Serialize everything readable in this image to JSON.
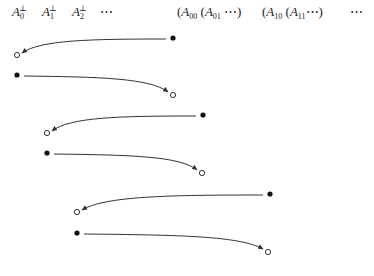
{
  "header": {
    "left_terms": [
      {
        "base": "A",
        "sub": "0",
        "sup": "⊥",
        "x": 12
      },
      {
        "base": "A",
        "sub": "1",
        "sup": "⊥",
        "x": 42
      },
      {
        "base": "A",
        "sub": "2",
        "sup": "⊥",
        "x": 72
      }
    ],
    "left_ellipsis": {
      "text": "⋯",
      "x": 100
    },
    "group_a": {
      "open1": "(",
      "A00_base": "A",
      "A00_sub": "00",
      "open2": "(",
      "A01_base": "A",
      "A01_sub": "01",
      "tail": "⋯)",
      "x": 177
    },
    "group_b": {
      "open1": "(",
      "A10_base": "A",
      "A10_sub": "10",
      "open2": "(",
      "A11_base": "A",
      "A11_sub": "11",
      "tail": "⋯)",
      "x": 262
    },
    "right_ellipsis": {
      "text": "⋯",
      "x": 350
    }
  },
  "diagram": {
    "stroke_color": "#333333",
    "groups": [
      {
        "back_arrow": {
          "from": [
            173,
            38
          ],
          "to": [
            17,
            55
          ]
        },
        "forward_arrow": {
          "from": [
            17,
            75
          ],
          "to": [
            173,
            95
          ]
        }
      },
      {
        "back_arrow": {
          "from": [
            203,
            115
          ],
          "to": [
            47,
            133
          ]
        },
        "forward_arrow": {
          "from": [
            47,
            153
          ],
          "to": [
            202,
            173
          ]
        }
      },
      {
        "back_arrow": {
          "from": [
            270,
            194
          ],
          "to": [
            77,
            212
          ]
        },
        "forward_arrow": {
          "from": [
            77,
            233
          ],
          "to": [
            268,
            252
          ]
        }
      }
    ],
    "legend": {
      "filled_dot": "source point",
      "open_dot": "target point"
    }
  }
}
